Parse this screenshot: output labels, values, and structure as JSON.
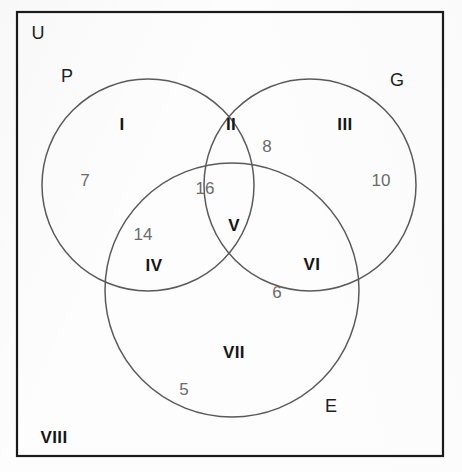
{
  "figure": {
    "kind": "venn-diagram-3-set",
    "universe_label": "U",
    "background_color": "#fdfdfd",
    "border_color": "#1a1a1a",
    "circle_stroke_color": "#5a5a5a",
    "region_label_color": "#161616",
    "count_label_color": "#6b6b6b"
  },
  "frame": {
    "x": 17,
    "y": 12,
    "width": 426,
    "height": 444
  },
  "sets": [
    {
      "id": "set-p",
      "label": "P",
      "label_x": 67,
      "label_y": 76,
      "cx": 148,
      "cy": 185,
      "r": 106
    },
    {
      "id": "set-g",
      "label": "G",
      "label_x": 397,
      "label_y": 80,
      "cx": 310,
      "cy": 185,
      "r": 106
    },
    {
      "id": "set-e",
      "label": "E",
      "label_x": 331,
      "label_y": 406,
      "cx": 232,
      "cy": 290,
      "r": 127
    }
  ],
  "universe": {
    "label": "U",
    "label_x": 38,
    "label_y": 33
  },
  "regions": [
    {
      "id": "region-i",
      "label": "I",
      "label_x": 122,
      "label_y": 124,
      "count": "7",
      "count_x": 85,
      "count_y": 180
    },
    {
      "id": "region-ii",
      "label": "II",
      "label_x": 231,
      "label_y": 124,
      "count": "8",
      "count_x": 267,
      "count_y": 146
    },
    {
      "id": "region-iii",
      "label": "III",
      "label_x": 345,
      "label_y": 124,
      "count": "10",
      "count_x": 381,
      "count_y": 180
    },
    {
      "id": "region-iv",
      "label": "IV",
      "label_x": 154,
      "label_y": 265,
      "count": "14",
      "count_x": 143,
      "count_y": 234
    },
    {
      "id": "region-v",
      "label": "V",
      "label_x": 234,
      "label_y": 225,
      "count": "16",
      "count_x": 205,
      "count_y": 188
    },
    {
      "id": "region-vi",
      "label": "VI",
      "label_x": 312,
      "label_y": 264,
      "count": "6",
      "count_x": 277,
      "count_y": 292
    },
    {
      "id": "region-vii",
      "label": "VII",
      "label_x": 234,
      "label_y": 352,
      "count": "5",
      "count_x": 184,
      "count_y": 389
    },
    {
      "id": "region-viii",
      "label": "VIII",
      "label_x": 54,
      "label_y": 437,
      "count": "",
      "count_x": 0,
      "count_y": 0
    }
  ],
  "chart_data": {
    "type": "venn",
    "title": "",
    "sets": [
      "P",
      "G",
      "E"
    ],
    "universe": "U",
    "regions": [
      {
        "roman": "I",
        "description": "P only",
        "value": 7
      },
      {
        "roman": "II",
        "description": "P and G only",
        "value": 8
      },
      {
        "roman": "III",
        "description": "G only",
        "value": 10
      },
      {
        "roman": "IV",
        "description": "P and E only",
        "value": 14
      },
      {
        "roman": "V",
        "description": "P and G and E",
        "value": 16
      },
      {
        "roman": "VI",
        "description": "G and E only",
        "value": 6
      },
      {
        "roman": "VII",
        "description": "E only",
        "value": 5
      },
      {
        "roman": "VIII",
        "description": "outside all sets",
        "value": null
      }
    ]
  }
}
